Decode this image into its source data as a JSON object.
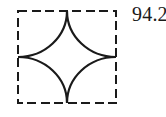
{
  "figure": {
    "name": "dashed-square-with-four-quarter-arcs",
    "stroke_color": "#1a1a1a",
    "fill_color": "#ffffff",
    "background_color": "#ffffff",
    "square": {
      "x": 18,
      "y": 11,
      "side": 98,
      "border_style": "dashed",
      "dash_length": 8,
      "dash_gap": 4,
      "stroke_width": 2.2
    },
    "arcs": {
      "count": 4,
      "style": "quarter-circle",
      "radius": 49,
      "centers": "square corners",
      "meeting_points": "midpoints of square sides"
    },
    "arc_path": "M 67 11 A 49 49 0 0 1 18 60 A 49 49 0 0 1 67 109 A 49 49 0 0 1 116 60 A 49 49 0 0 1 67 11 Z"
  },
  "annotations": {
    "value_label": "94.2"
  }
}
